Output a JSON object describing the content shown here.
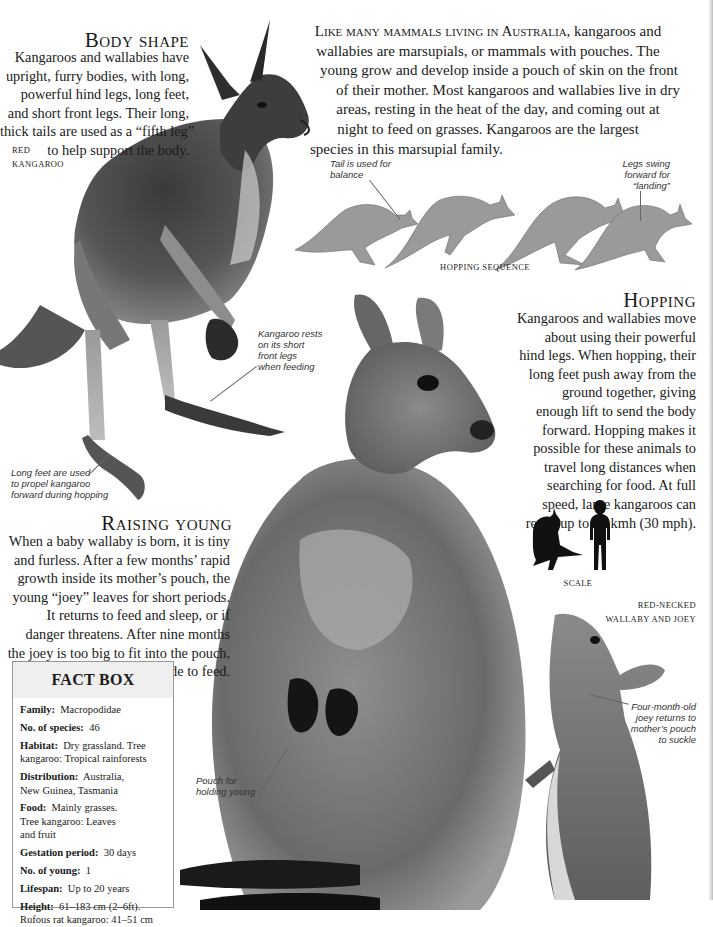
{
  "intro": {
    "lead": "Like many mammals living in Australia,",
    "lines": [
      " kangaroos and",
      "wallabies are marsupials, or mammals with pouches. The",
      "young grow and develop inside a pouch of skin on the front",
      "of their mother. Most kangaroos and wallabies live in dry",
      "areas, resting in the heat of the day, and coming out at",
      "night to feed on grasses. Kangaroos are the largest",
      "species in this marsupial family."
    ]
  },
  "body_shape": {
    "heading": "Body shape",
    "lines": [
      "Kangaroos and wallabies have",
      "upright, furry bodies, with long,",
      "powerful hind legs, long feet,",
      "and short front legs. Their long,",
      "thick tails are used as a “fifth leg”",
      "to help support the body."
    ],
    "caption": [
      "RED",
      "KANGAROO"
    ]
  },
  "red_kangaroo_annotations": {
    "front_legs": [
      "Kangaroo rests",
      "on its short",
      "front legs",
      "when feeding"
    ],
    "feet": [
      "Long feet are used",
      "to propel kangaroo",
      "forward during hopping"
    ]
  },
  "hopping_sequence": {
    "caption": "HOPPING SEQUENCE",
    "tail_note": [
      "Tail is used for",
      "balance"
    ],
    "legs_note": [
      "Legs swing",
      "forward for",
      "“landing”"
    ]
  },
  "hopping": {
    "heading": "Hopping",
    "lines": [
      "Kangaroos and wallabies move",
      "about using their powerful",
      "hind legs. When hopping, their",
      "long feet push away from the",
      "ground together, giving",
      "enough lift to send the body",
      "forward. Hopping makes it",
      "possible for these animals to",
      "travel long distances when",
      "searching for food. At full",
      "speed, large kangaroos can",
      "reach up to 48 kmh (30 mph)."
    ]
  },
  "scale": {
    "caption": "SCALE"
  },
  "raising_young": {
    "heading": "Raising young",
    "lines": [
      "When a baby wallaby is born, it is tiny",
      "and furless. After a few months’ rapid",
      "growth inside its mother’s pouch, the",
      "young “joey” leaves for short periods.",
      "It returns to feed and sleep, or if",
      "danger threatens. After nine months",
      "the joey is too big to fit into the pouch,",
      "but still sticks its head inside to feed."
    ]
  },
  "wallaby": {
    "caption": [
      "RED-NECKED",
      "WALLABY AND JOEY"
    ],
    "pouch_note": [
      "Pouch for",
      "holding young"
    ],
    "joey_note": [
      "Four-month-old",
      "joey returns to",
      "mother’s pouch",
      "to suckle"
    ]
  },
  "fact_box": {
    "title": "FACT BOX",
    "rows": [
      {
        "label": "Family:",
        "value": [
          "Macropodidae"
        ]
      },
      {
        "label": "No. of species:",
        "value": [
          "46"
        ]
      },
      {
        "label": "Habitat:",
        "value": [
          "Dry grassland. Tree",
          "kangaroo: Tropical rainforests"
        ]
      },
      {
        "label": "Distribution:",
        "value": [
          "Australia,",
          "New Guinea, Tasmania"
        ]
      },
      {
        "label": "Food:",
        "value": [
          "Mainly grasses.",
          "Tree kangaroo: Leaves",
          "and fruit"
        ]
      },
      {
        "label": "Gestation period:",
        "value": [
          "30 days"
        ]
      },
      {
        "label": "No. of young:",
        "value": [
          "1"
        ]
      },
      {
        "label": "Lifespan:",
        "value": [
          "Up to 20 years"
        ]
      },
      {
        "label": "Height:",
        "value": [
          "61–183 cm (2–6ft).",
          "Rufous rat kangaroo: 41–51 cm"
        ]
      }
    ]
  },
  "colors": {
    "text": "#1a1a1a",
    "fact_box_header": "#efefef",
    "fact_box_border": "#999999"
  }
}
